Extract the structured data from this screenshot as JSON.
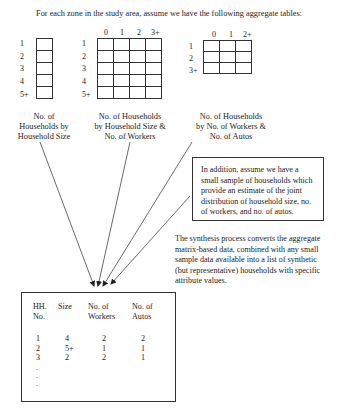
{
  "intro_text": "For each zone in the study area, assume we have the following aggregate tables:",
  "tables": [
    {
      "id": "household-size",
      "row_labels": [
        "1",
        "2",
        "3",
        "4",
        "5+"
      ],
      "col_labels": [],
      "caption_lines": [
        "No. of",
        "Households by",
        "Household Size"
      ]
    },
    {
      "id": "size-by-workers",
      "row_labels": [
        "1",
        "2",
        "3",
        "4",
        "5+"
      ],
      "col_labels": [
        "0",
        "1",
        "2",
        "3+"
      ],
      "caption_lines": [
        "No. of Households",
        "by Household Size &",
        "No. of Workers"
      ]
    },
    {
      "id": "workers-by-autos",
      "row_labels": [
        "1",
        "2",
        "3+"
      ],
      "col_labels": [
        "0",
        "1",
        "2+"
      ],
      "caption_lines": [
        "No. of Households",
        "by No. of Workers &",
        "No. of Autos"
      ]
    }
  ],
  "sample_box": {
    "lines": [
      "In addition, assume we have a",
      "small sample of households which",
      "provide an estimate of the joint",
      "distribution of household size, no.",
      "of workers, and no. of autos."
    ]
  },
  "synthesis_text": {
    "lines": [
      "The synthesis process converts the aggregate",
      "matrix-based data, combined with any small",
      "sample data available into a list of synthetic",
      "(but representative) households with specific",
      "attribute values."
    ]
  },
  "output_table": {
    "headers": [
      [
        "HH.",
        "No."
      ],
      [
        "Size",
        ""
      ],
      [
        "No. of",
        "Workers"
      ],
      [
        "No. of",
        "Autos"
      ]
    ],
    "rows": [
      [
        "1",
        "4",
        "2",
        "2"
      ],
      [
        "2",
        "5+",
        "1",
        "1"
      ],
      [
        "3",
        "2",
        "2",
        "1"
      ]
    ],
    "ellipsis": [
      ".",
      ".",
      "."
    ]
  }
}
